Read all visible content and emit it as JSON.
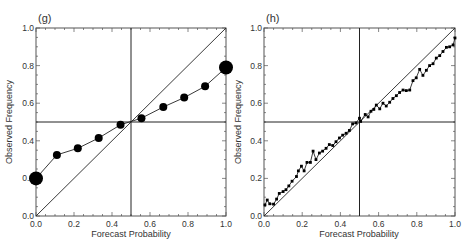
{
  "figure": {
    "panels": [
      {
        "label": "(g)",
        "xlabel": "Forecast Probability",
        "ylabel": "Observed Frequency",
        "xticks": [
          "0.0",
          "0.2",
          "0.4",
          "0.6",
          "0.8",
          "1.0"
        ],
        "yticks": [
          "0.0",
          "0.2",
          "0.4",
          "0.6",
          "0.8",
          "1.0"
        ]
      },
      {
        "label": "(h)",
        "xlabel": "Forecast Probability",
        "ylabel": "Observed Frequency",
        "xticks": [
          "0.0",
          "0.2",
          "0.4",
          "0.6",
          "0.8",
          "1.0"
        ],
        "yticks": [
          "0.0",
          "0.2",
          "0.4",
          "0.6",
          "0.8",
          "1.0"
        ]
      }
    ]
  },
  "colors": {
    "axis": "#555555",
    "line": "#222222",
    "marker": "#000000",
    "text": "#333333"
  },
  "chart_data": [
    {
      "type": "line",
      "title": "(g)",
      "xlabel": "Forecast Probability",
      "ylabel": "Observed Frequency",
      "xlim": [
        0,
        1
      ],
      "ylim": [
        0,
        1
      ],
      "grid": false,
      "reference_lines": {
        "diagonal": true,
        "vertical_x": 0.5,
        "horizontal_y": 0.5
      },
      "series": [
        {
          "name": "reliability",
          "marker": "circle",
          "x": [
            0.0,
            0.11,
            0.22,
            0.33,
            0.445,
            0.555,
            0.67,
            0.78,
            0.89,
            1.0
          ],
          "y": [
            0.2,
            0.325,
            0.36,
            0.415,
            0.485,
            0.52,
            0.58,
            0.63,
            0.69,
            0.79
          ],
          "marker_size": [
            7,
            4,
            4,
            4,
            4,
            4,
            4,
            4,
            4,
            7
          ]
        }
      ]
    },
    {
      "type": "line",
      "title": "(h)",
      "xlabel": "Forecast Probability",
      "ylabel": "Observed Frequency",
      "xlim": [
        0,
        1
      ],
      "ylim": [
        0,
        1
      ],
      "grid": false,
      "reference_lines": {
        "diagonal": true,
        "vertical_x": 0.5,
        "horizontal_y": 0.5
      },
      "series": [
        {
          "name": "reliability",
          "marker": "square",
          "x": [
            0.005,
            0.017,
            0.03,
            0.05,
            0.066,
            0.08,
            0.1,
            0.115,
            0.13,
            0.147,
            0.17,
            0.18,
            0.196,
            0.21,
            0.225,
            0.243,
            0.257,
            0.272,
            0.29,
            0.307,
            0.325,
            0.342,
            0.36,
            0.377,
            0.395,
            0.412,
            0.43,
            0.447,
            0.464,
            0.482,
            0.5,
            0.506,
            0.53,
            0.545,
            0.56,
            0.575,
            0.588,
            0.606,
            0.623,
            0.64,
            0.658,
            0.675,
            0.693,
            0.71,
            0.728,
            0.745,
            0.763,
            0.78,
            0.797,
            0.815,
            0.832,
            0.85,
            0.867,
            0.885,
            0.902,
            0.92,
            0.937,
            0.955,
            0.972,
            0.99,
            1.0
          ],
          "y": [
            0.059,
            0.085,
            0.065,
            0.063,
            0.09,
            0.12,
            0.13,
            0.14,
            0.16,
            0.185,
            0.21,
            0.24,
            0.265,
            0.24,
            0.285,
            0.285,
            0.345,
            0.3,
            0.335,
            0.345,
            0.36,
            0.38,
            0.375,
            0.395,
            0.415,
            0.43,
            0.44,
            0.455,
            0.49,
            0.495,
            0.52,
            0.503,
            0.54,
            0.527,
            0.557,
            0.567,
            0.59,
            0.57,
            0.6,
            0.585,
            0.605,
            0.625,
            0.64,
            0.657,
            0.67,
            0.667,
            0.67,
            0.72,
            0.735,
            0.78,
            0.748,
            0.775,
            0.8,
            0.81,
            0.84,
            0.853,
            0.875,
            0.897,
            0.9,
            0.91,
            0.947
          ]
        }
      ]
    }
  ]
}
